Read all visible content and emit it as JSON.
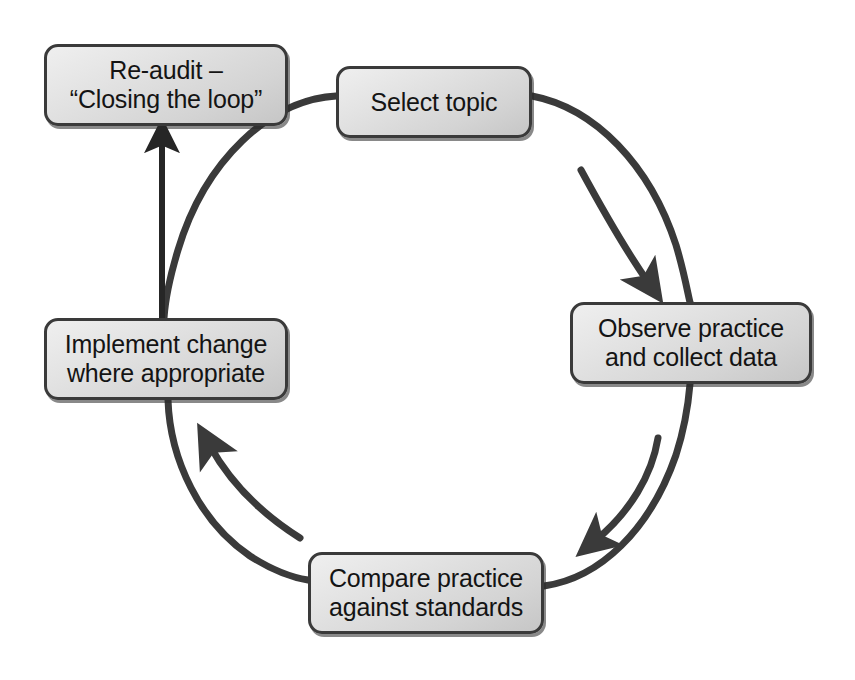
{
  "diagram": {
    "type": "circular-process-cycle",
    "background_color": "#ffffff",
    "ring_color": "#3a3a3a",
    "box_border_color": "#3a3a3a",
    "box_fill_light": "#efefef",
    "box_fill_dark": "#c6c6c6",
    "text_color": "#141414",
    "nodes": [
      {
        "id": "select-topic",
        "label": "Select topic",
        "position": "top"
      },
      {
        "id": "observe-practice",
        "label": "Observe practice\nand collect data",
        "position": "right"
      },
      {
        "id": "compare-practice",
        "label": "Compare practice\nagainst standards",
        "position": "bottom"
      },
      {
        "id": "implement-change",
        "label": "Implement change\nwhere appropriate",
        "position": "left"
      },
      {
        "id": "re-audit",
        "label": "Re-audit –\n“Closing the loop”",
        "position": "top-left"
      }
    ],
    "connectors": [
      {
        "id": "select-to-observe",
        "from": "select-topic",
        "to": "observe-practice",
        "style": "curved-arrow",
        "direction": "clockwise"
      },
      {
        "id": "observe-to-compare",
        "from": "observe-practice",
        "to": "compare-practice",
        "style": "curved-arrow",
        "direction": "clockwise"
      },
      {
        "id": "compare-to-implement",
        "from": "compare-practice",
        "to": "implement-change",
        "style": "curved-arrow",
        "direction": "clockwise"
      },
      {
        "id": "implement-to-reaudit",
        "from": "implement-change",
        "to": "re-audit",
        "style": "straight-arrow",
        "direction": "up"
      }
    ]
  }
}
